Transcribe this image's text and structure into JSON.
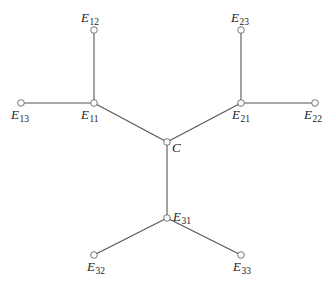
{
  "diagram": {
    "type": "tree",
    "nodes": [
      {
        "id": "C",
        "base": "C",
        "sub": "",
        "x": 167,
        "y": 142,
        "label_x": 172,
        "label_y": 152
      },
      {
        "id": "E11",
        "base": "E",
        "sub": "11",
        "x": 94,
        "y": 103,
        "label_x": 81,
        "label_y": 119
      },
      {
        "id": "E12",
        "base": "E",
        "sub": "12",
        "x": 94,
        "y": 30,
        "label_x": 81,
        "label_y": 22
      },
      {
        "id": "E13",
        "base": "E",
        "sub": "13",
        "x": 21,
        "y": 103,
        "label_x": 11,
        "label_y": 119
      },
      {
        "id": "E21",
        "base": "E",
        "sub": "21",
        "x": 241,
        "y": 103,
        "label_x": 232,
        "label_y": 119
      },
      {
        "id": "E22",
        "base": "E",
        "sub": "22",
        "x": 315,
        "y": 103,
        "label_x": 304,
        "label_y": 119
      },
      {
        "id": "E23",
        "base": "E",
        "sub": "23",
        "x": 241,
        "y": 30,
        "label_x": 231,
        "label_y": 22
      },
      {
        "id": "E31",
        "base": "E",
        "sub": "31",
        "x": 167,
        "y": 218,
        "label_x": 173,
        "label_y": 221
      },
      {
        "id": "E32",
        "base": "E",
        "sub": "32",
        "x": 94,
        "y": 255,
        "label_x": 87,
        "label_y": 271
      },
      {
        "id": "E33",
        "base": "E",
        "sub": "33",
        "x": 241,
        "y": 255,
        "label_x": 233,
        "label_y": 271
      }
    ],
    "edges": [
      {
        "from": "C",
        "to": "E11"
      },
      {
        "from": "C",
        "to": "E21"
      },
      {
        "from": "C",
        "to": "E31"
      },
      {
        "from": "E11",
        "to": "E12"
      },
      {
        "from": "E11",
        "to": "E13"
      },
      {
        "from": "E21",
        "to": "E22"
      },
      {
        "from": "E21",
        "to": "E23"
      },
      {
        "from": "E31",
        "to": "E32"
      },
      {
        "from": "E31",
        "to": "E33"
      }
    ]
  }
}
